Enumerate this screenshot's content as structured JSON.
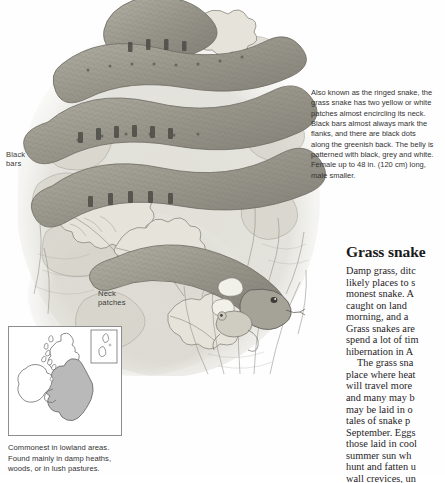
{
  "page": {
    "background_color": "#fefefe"
  },
  "illustration": {
    "name": "grass-snake-pencil-illustration",
    "subject": "Grass snake coiled among fallen leaves with a frog",
    "style": "graphite pencil and pale wash",
    "ink_color": "#7e7e78",
    "leaf_color": "#c9c7bd",
    "snake_color": "#9a978c"
  },
  "callouts": [
    {
      "id": "black-bars",
      "text": "Black\nbars"
    },
    {
      "id": "neck-patches",
      "text": "Neck\npatches"
    }
  ],
  "caption": {
    "lines": [
      "Also known as the ringed snake, the",
      "grass snake has two yellow or white",
      "patches almost encircling its neck.",
      "Black bars almost always mark the",
      "flanks, and there are black dots",
      "along the greenish back. The belly is",
      "patterned with black, grey and white.",
      "Female up to 48 in. (120 cm) long,",
      "male smaller."
    ]
  },
  "article": {
    "title": "Grass snake",
    "lines": [
      {
        "text": "Damp grass, ditc",
        "indent": false
      },
      {
        "text": "likely places to s",
        "indent": false
      },
      {
        "text": "monest snake. A",
        "indent": false
      },
      {
        "text": "caught on land",
        "indent": false
      },
      {
        "text": "morning, and a",
        "indent": false
      },
      {
        "text": "Grass snakes are",
        "indent": false
      },
      {
        "text": "spend a lot of tim",
        "indent": false
      },
      {
        "text": "hibernation in A",
        "indent": false
      },
      {
        "text": "The grass sna",
        "indent": true
      },
      {
        "text": "place where heat",
        "indent": false
      },
      {
        "text": "will travel more",
        "indent": false
      },
      {
        "text": "and many may b",
        "indent": false
      },
      {
        "text": "may be laid in o",
        "indent": false
      },
      {
        "text": "tales of snake p",
        "indent": false
      },
      {
        "text": "September. Eggs",
        "indent": false
      },
      {
        "text": "those laid in cool",
        "indent": false
      },
      {
        "text": "summer sun wh",
        "indent": false
      },
      {
        "text": "hunt and fatten u",
        "indent": false
      },
      {
        "text": "wall crevices, un",
        "indent": false
      },
      {
        "text": "taken by birds, h",
        "indent": false
      }
    ]
  },
  "map": {
    "name": "distribution-map-british-isles",
    "shaded_region_label": "England and Wales",
    "shade_color": "#b9b9b9",
    "outline_color": "#6f6f6f",
    "inset_label": "Shetland inset",
    "caption_lines": [
      "Commonest in lowland areas.",
      "Found mainly in damp heaths,",
      "woods, or in lush pastures."
    ]
  }
}
